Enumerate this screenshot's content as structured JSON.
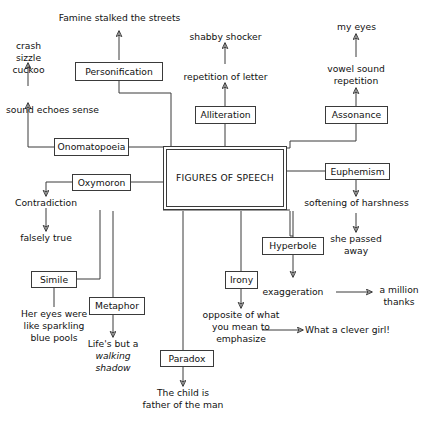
{
  "diagram": {
    "center": {
      "label": "FIGURES\nOF SPEECH"
    },
    "nodes": [
      {
        "id": "personification",
        "label": "Personification"
      },
      {
        "id": "onomatopoeia",
        "label": "Onomatopoeia"
      },
      {
        "id": "alliteration",
        "label": "Alliteration"
      },
      {
        "id": "assonance",
        "label": "Assonance"
      },
      {
        "id": "euphemism",
        "label": "Euphemism"
      },
      {
        "id": "oxymoron",
        "label": "Oxymoron"
      },
      {
        "id": "simile",
        "label": "Simile"
      },
      {
        "id": "metaphor",
        "label": "Metaphor"
      },
      {
        "id": "paradox",
        "label": "Paradox"
      },
      {
        "id": "irony",
        "label": "Irony"
      },
      {
        "id": "hyperbole",
        "label": "Hyperbole"
      }
    ],
    "labels": [
      {
        "id": "famine",
        "text": "Famine stalked the streets"
      },
      {
        "id": "crash",
        "text": "crash\nsizzle\ncuckoo"
      },
      {
        "id": "sound-echoes",
        "text": "sound echoes sense"
      },
      {
        "id": "shabby",
        "text": "shabby shocker"
      },
      {
        "id": "repetition",
        "text": "repetition of letter"
      },
      {
        "id": "my-eyes",
        "text": "my eyes"
      },
      {
        "id": "vowel",
        "text": "vowel sound\nrepetition"
      },
      {
        "id": "softening",
        "text": "softening of harshness"
      },
      {
        "id": "passed-away",
        "text": "she passed\naway"
      },
      {
        "id": "contradiction",
        "text": "Contradiction"
      },
      {
        "id": "falsely-true",
        "text": "falsely true"
      },
      {
        "id": "her-eyes",
        "text": "Her eyes were\nlike sparkling\nblue pools"
      },
      {
        "id": "lifes-but",
        "text": "Life's but a"
      },
      {
        "id": "walking",
        "text": "walking\nshadow"
      },
      {
        "id": "child",
        "text": "The child is\nfather of the man"
      },
      {
        "id": "opposite",
        "text": "opposite of what\nyou mean to\nemphasize"
      },
      {
        "id": "clever-girl",
        "text": "What a clever girl!"
      },
      {
        "id": "exaggeration",
        "text": "exaggeration"
      },
      {
        "id": "million",
        "text": "a million\nthanks"
      }
    ],
    "colors": {
      "stroke": "#3a3a3a",
      "text": "#111111",
      "background": "#ffffff"
    }
  }
}
